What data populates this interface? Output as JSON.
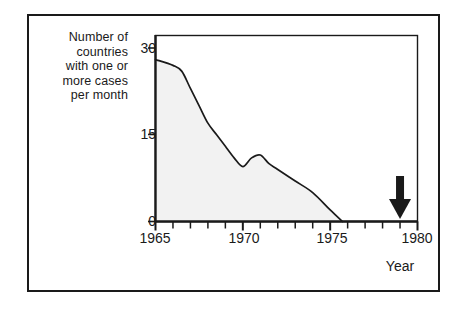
{
  "figure": {
    "background_color": "#ffffff",
    "frame_color": "#1a1a1a",
    "axis_color": "#1a1a1a",
    "curve_color": "#1a1a1a",
    "area_fill_color": "#f2f2f2"
  },
  "y_axis_caption": {
    "line1": "Number of",
    "line2": "countries",
    "line3": "with one or",
    "line4": "more cases",
    "line5": "per month"
  },
  "annotation": {
    "line1": "smallpox",
    "line2": "officially",
    "line3": "eradicated",
    "marker_icon": "down-arrow-icon",
    "marker_year": 1979
  },
  "x_axis_title": "Year",
  "chart_data": {
    "type": "area",
    "title": "",
    "subtitle": "",
    "xlabel": "Year",
    "ylabel": "Number of countries with one or more cases per month",
    "xlim": [
      1965,
      1980
    ],
    "ylim": [
      0,
      32
    ],
    "xticks": [
      1965,
      1966,
      1967,
      1968,
      1969,
      1970,
      1971,
      1972,
      1973,
      1974,
      1975,
      1976,
      1977,
      1978,
      1979,
      1980
    ],
    "xtick_labels": [
      "1965",
      "",
      "",
      "",
      "",
      "1970",
      "",
      "",
      "",
      "",
      "1975",
      "",
      "",
      "",
      "",
      "1980"
    ],
    "yticks": [
      0,
      15,
      30
    ],
    "ytick_labels": [
      "0",
      "15",
      "30"
    ],
    "grid": false,
    "legend": "none",
    "filled": true,
    "series": [
      {
        "name": "Countries with one or more smallpox cases per month",
        "x": [
          1965,
          1966,
          1966.5,
          1967,
          1967.5,
          1968,
          1968.5,
          1969,
          1969.5,
          1970,
          1970.5,
          1971,
          1971.5,
          1972,
          1973,
          1974,
          1975,
          1975.7
        ],
        "values": [
          28,
          27,
          26,
          23,
          20,
          17,
          15,
          13,
          11,
          9.5,
          11,
          11.5,
          10,
          9,
          7,
          5,
          2,
          0
        ]
      }
    ],
    "annotations": [
      {
        "text": "smallpox officially eradicated",
        "x": 1979,
        "y": 0,
        "marker": "down-arrow"
      }
    ]
  }
}
